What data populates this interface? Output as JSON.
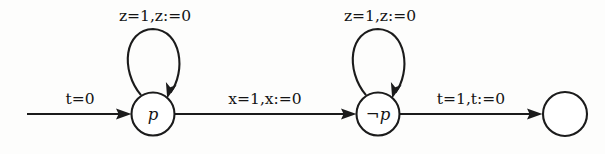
{
  "diagram": {
    "kind": "state-transition-automaton",
    "title": "",
    "background_color": "#fdfdfc",
    "stroke_color": "#1b1b1b",
    "nodes": [
      {
        "id": "p",
        "label": "p",
        "label_prefix": "",
        "cx": 153,
        "cy": 114,
        "r": 21.5,
        "has_label": true
      },
      {
        "id": "notp",
        "label": "p",
        "label_prefix": "¬",
        "cx": 378,
        "cy": 114,
        "r": 21.5,
        "has_label": true
      },
      {
        "id": "final",
        "label": "",
        "label_prefix": "",
        "cx": 565,
        "cy": 114,
        "r": 22.0,
        "has_label": false
      }
    ],
    "edges": [
      {
        "id": "entry",
        "from": "",
        "to": "p",
        "type": "incoming",
        "guard": "t=0",
        "action": "",
        "label": "t=0",
        "label_x": 80,
        "label_y": 104
      },
      {
        "id": "loop-p",
        "from": "p",
        "to": "p",
        "type": "self-loop",
        "guard": "z=1",
        "action": "z:=0",
        "label": "z=1,z:=0",
        "label_x": 155,
        "label_y": 21
      },
      {
        "id": "p-to-notp",
        "from": "p",
        "to": "notp",
        "type": "transition",
        "guard": "x=1",
        "action": "x:=0",
        "label": "x=1,x:=0",
        "label_x": 265,
        "label_y": 104
      },
      {
        "id": "loop-notp",
        "from": "notp",
        "to": "notp",
        "type": "self-loop",
        "guard": "z=1",
        "action": "z:=0",
        "label": "z=1,z:=0",
        "label_x": 380,
        "label_y": 21
      },
      {
        "id": "notp-to-final",
        "from": "notp",
        "to": "final",
        "type": "transition",
        "guard": "t=1",
        "action": "t:=0",
        "label": "t=1,t:=0",
        "label_x": 471,
        "label_y": 104
      }
    ]
  }
}
